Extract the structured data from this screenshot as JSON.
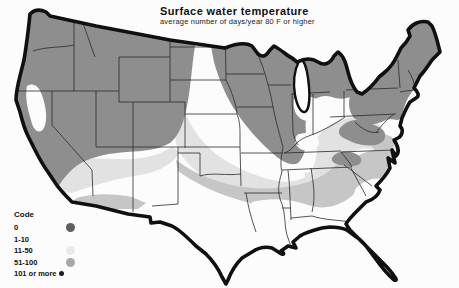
{
  "title": "Surface water temperature",
  "subtitle": "average number of days/year 80 F or higher",
  "legend": {
    "heading": "Code",
    "items": [
      {
        "label": "0",
        "color": "#5f5f5f"
      },
      {
        "label": "1-10",
        "color": "#fbfbfb"
      },
      {
        "label": "11-50",
        "color": "#e9e9e9"
      },
      {
        "label": "51-100",
        "color": "#a8a8a8"
      },
      {
        "label": "101 or more",
        "color": "#1c1c1c"
      }
    ]
  },
  "map": {
    "name": "united-states-surface-water-temperature",
    "shade_colors": {
      "white": "#fcfcfc",
      "light": "#e2e2e2",
      "medium": "#c6c6c6",
      "dark": "#8e8e8e"
    },
    "outline_color": "#101010",
    "state_line_color": "#2b2b2b",
    "lake_fill": "#ffffff"
  }
}
